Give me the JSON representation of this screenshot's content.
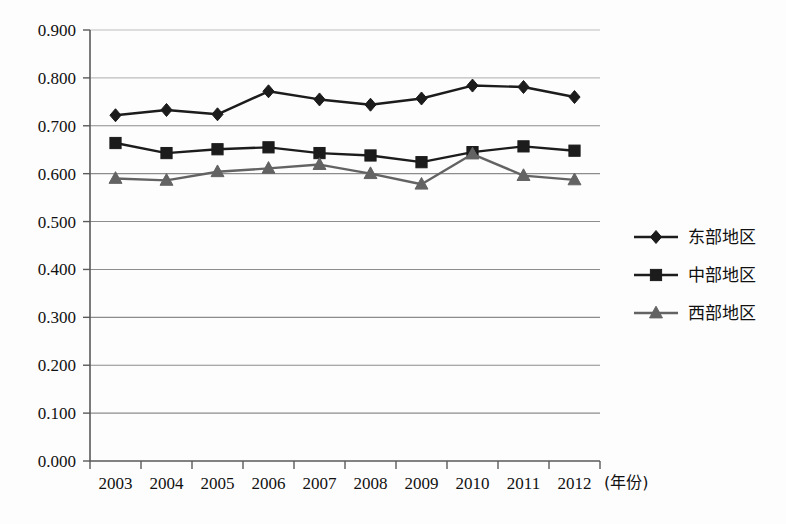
{
  "chart_data": {
    "type": "line",
    "title": "",
    "subtitle": "",
    "xlabel": "(年份)",
    "ylabel": "",
    "categories": [
      "2003",
      "2004",
      "2005",
      "2006",
      "2007",
      "2008",
      "2009",
      "2010",
      "2011",
      "2012"
    ],
    "x_tick_labels": [
      "2003",
      "2004",
      "2005",
      "2006",
      "2007",
      "2008",
      "2009",
      "2010",
      "2011",
      "2012"
    ],
    "y_tick_labels": [
      "0.000",
      "0.100",
      "0.200",
      "0.300",
      "0.400",
      "0.500",
      "0.600",
      "0.700",
      "0.800",
      "0.900"
    ],
    "y_tick_values": [
      0.0,
      0.1,
      0.2,
      0.3,
      0.4,
      0.5,
      0.6,
      0.7,
      0.8,
      0.9
    ],
    "ylim": [
      0.0,
      0.9
    ],
    "grid": true,
    "grid_axis": "y",
    "legend_position": "right",
    "series": [
      {
        "name": "东部地区",
        "marker": "diamond",
        "color": "#1c1c1c",
        "values": [
          0.722,
          0.733,
          0.724,
          0.772,
          0.755,
          0.744,
          0.757,
          0.784,
          0.781,
          0.76
        ]
      },
      {
        "name": "中部地区",
        "marker": "square",
        "color": "#1c1c1c",
        "values": [
          0.664,
          0.643,
          0.651,
          0.655,
          0.643,
          0.638,
          0.624,
          0.645,
          0.657,
          0.648
        ]
      },
      {
        "name": "西部地区",
        "marker": "triangle",
        "color": "#636363",
        "values": [
          0.59,
          0.586,
          0.604,
          0.611,
          0.619,
          0.6,
          0.578,
          0.641,
          0.596,
          0.587
        ]
      }
    ]
  },
  "legend": {
    "items": [
      {
        "label": "东部地区",
        "marker": "diamond",
        "color": "#1c1c1c"
      },
      {
        "label": "中部地区",
        "marker": "square",
        "color": "#1c1c1c"
      },
      {
        "label": "西部地区",
        "marker": "triangle",
        "color": "#636363"
      }
    ]
  },
  "axes": {
    "x_unit_label": "(年份)"
  },
  "colors": {
    "background": "#fdfdfd",
    "gridline": "#8c8c8c",
    "axis": "#5a5a5a",
    "text": "#111111",
    "series_dark": "#1c1c1c",
    "series_gray": "#636363"
  }
}
